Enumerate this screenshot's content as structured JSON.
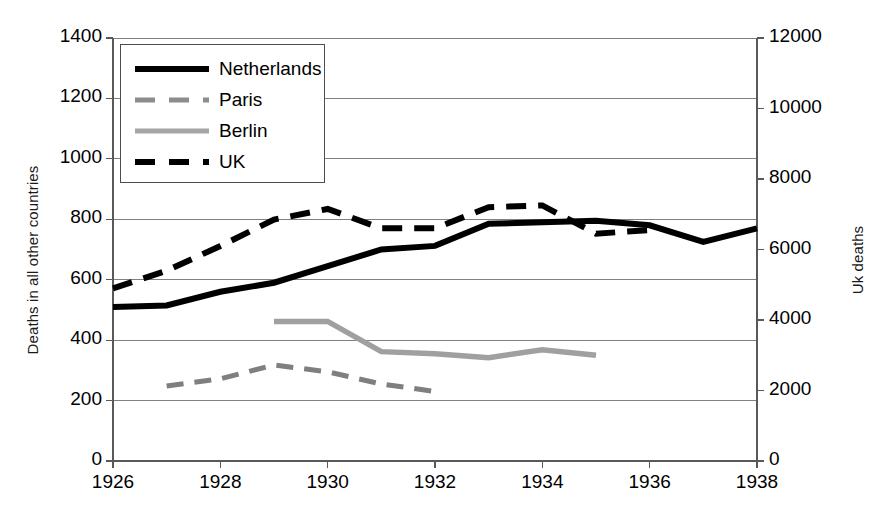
{
  "chart_data": {
    "type": "line",
    "title": "",
    "xlabel": "",
    "ylabel": "Deaths in all other countries",
    "y2label": "Uk deaths",
    "x": [
      1926,
      1927,
      1928,
      1929,
      1930,
      1931,
      1932,
      1933,
      1934,
      1935,
      1936,
      1937,
      1938
    ],
    "xlim": [
      1926,
      1938
    ],
    "ylim": [
      0,
      1400
    ],
    "y2lim": [
      0,
      12000
    ],
    "xticks": [
      "1926",
      "1928",
      "1930",
      "1932",
      "1934",
      "1936",
      "1938"
    ],
    "yticks": [
      "0",
      "200",
      "400",
      "600",
      "800",
      "1000",
      "1200",
      "1400"
    ],
    "y2ticks": [
      "0",
      "2000",
      "4000",
      "6000",
      "8000",
      "10000",
      "12000"
    ],
    "grid": "horizontal",
    "legend_position": "upper-left-inside",
    "series": [
      {
        "name": "Netherlands",
        "axis": "left",
        "style": "solid",
        "color": "#000000",
        "x": [
          1926,
          1927,
          1928,
          1929,
          1930,
          1931,
          1932,
          1933,
          1934,
          1935,
          1936,
          1937,
          1938
        ],
        "values": [
          510,
          515,
          560,
          590,
          645,
          700,
          712,
          785,
          790,
          795,
          780,
          725,
          770
        ]
      },
      {
        "name": "Paris",
        "axis": "left",
        "style": "dashed",
        "color": "#7f7f7f",
        "x": [
          1927,
          1928,
          1929,
          1930,
          1931,
          1932
        ],
        "values": [
          248,
          272,
          318,
          295,
          255,
          230
        ]
      },
      {
        "name": "Berlin",
        "axis": "left",
        "style": "solid",
        "color": "#a0a0a0",
        "x": [
          1929,
          1930,
          1931,
          1932,
          1933,
          1934,
          1935
        ],
        "values": [
          462,
          462,
          362,
          355,
          342,
          368,
          350
        ]
      },
      {
        "name": "UK",
        "axis": "right",
        "style": "dashed",
        "color": "#000000",
        "x": [
          1926,
          1927,
          1928,
          1929,
          1930,
          1931,
          1932,
          1933,
          1934,
          1935,
          1936
        ],
        "values": [
          4900,
          5400,
          6100,
          6850,
          7150,
          6600,
          6600,
          7200,
          7250,
          6450,
          6550
        ]
      }
    ],
    "legend": [
      {
        "label": "Netherlands",
        "style": "solid",
        "color": "#000000",
        "width": 6
      },
      {
        "label": "Paris",
        "style": "dashed",
        "color": "#8c8c8c",
        "width": 5
      },
      {
        "label": "Berlin",
        "style": "solid",
        "color": "#a6a6a6",
        "width": 5
      },
      {
        "label": "UK",
        "style": "dashed",
        "color": "#000000",
        "width": 6
      }
    ]
  }
}
